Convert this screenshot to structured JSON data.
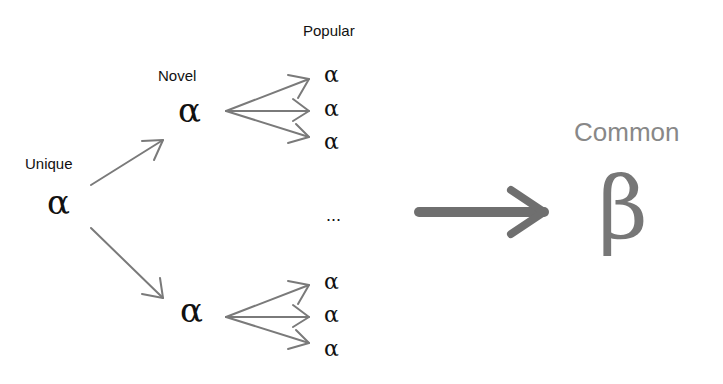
{
  "labels": {
    "popular": "Popular",
    "novel": "Novel",
    "unique": "Unique",
    "common": "Common"
  },
  "nodes": {
    "unique_symbol": "α",
    "novel_top_symbol": "α",
    "novel_bottom_symbol": "α",
    "popular_top": [
      "α",
      "α",
      "α"
    ],
    "popular_bottom": [
      "α",
      "α",
      "α"
    ],
    "ellipsis": "...",
    "common_symbol": "β"
  },
  "colors": {
    "arrow": "#777777",
    "text": "#111111",
    "common_label": "#888888",
    "common_symbol": "#777777"
  }
}
